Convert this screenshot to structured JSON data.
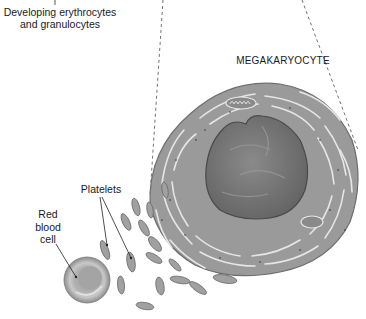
{
  "diagram": {
    "type": "biological-illustration",
    "labels": {
      "developing_cells": [
        "Developing erythrocytes",
        "and granulocytes"
      ],
      "megakaryocyte": "MEGAKARYOCYTE",
      "platelets": "Platelets",
      "red_blood_cell": [
        "Red",
        "blood",
        "cell"
      ]
    },
    "colors": {
      "background": "#ffffff",
      "cytoplasm": "#9a9a9a",
      "cytoplasm_edge": "#6e6e6e",
      "nucleus": "#7a7a7a",
      "nucleus_dark": "#5a5a5a",
      "membrane_channels": "#e6e6e6",
      "rbc": "#a8a8a8",
      "rbc_center": "#bdbdbd",
      "text": "#1a1a1a",
      "leader_lines": "#333333"
    }
  }
}
